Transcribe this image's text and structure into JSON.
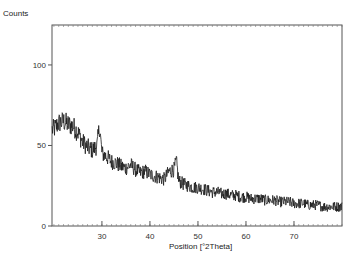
{
  "chart_data": {
    "type": "line",
    "title": "",
    "xlabel": "Position [°2Theta]",
    "ylabel": "Counts",
    "xlim": [
      19.6,
      80.0
    ],
    "ylim": [
      0,
      124.8
    ],
    "grid": false,
    "legend": null,
    "x_ticks": [
      30,
      40,
      50,
      60,
      70
    ],
    "y_ticks": [
      0,
      50,
      100
    ],
    "line_color": "#1a1a1a",
    "series": [
      {
        "name": "Scan",
        "x": [
          20,
          21,
          22,
          23,
          24,
          25,
          26,
          27,
          28,
          29,
          29.5,
          30,
          31,
          32,
          33,
          34,
          35,
          36,
          37,
          38,
          39,
          40,
          41,
          42,
          43,
          44,
          45,
          45.5,
          46,
          47,
          48,
          49,
          50,
          51,
          52,
          53,
          54,
          55,
          56,
          57,
          58,
          59,
          60,
          61,
          62,
          63,
          64,
          65,
          66,
          67,
          68,
          69,
          70,
          71,
          72,
          73,
          74,
          75,
          76,
          77,
          78,
          79,
          80
        ],
        "values": [
          60,
          64,
          65,
          63,
          62,
          58,
          52,
          49,
          47,
          50,
          62,
          45,
          43,
          40,
          39,
          37,
          36,
          38,
          35,
          33,
          34,
          32,
          31,
          30,
          29,
          34,
          35,
          40,
          28,
          26,
          25,
          24,
          24,
          23,
          22,
          21,
          21,
          20,
          20,
          19,
          19,
          18,
          18,
          17,
          17,
          17,
          16,
          16,
          16,
          15,
          15,
          15,
          14,
          14,
          14,
          13,
          13,
          13,
          12,
          12,
          12,
          12,
          12
        ]
      }
    ],
    "noise_amplitude": 4
  },
  "axes": {
    "ylabel_text": "Counts",
    "xlabel_text": "Position [°2Theta]"
  }
}
